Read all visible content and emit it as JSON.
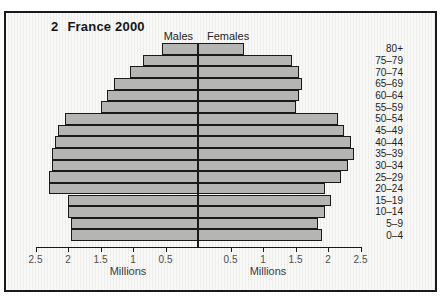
{
  "colors": {
    "background": "#f2f2f0",
    "frame_border": "#1a1a1a",
    "bar_fill": "#b5b5b3",
    "bar_border": "#1a1a1a",
    "axis_text": "#4d4d4d"
  },
  "chart_data": {
    "type": "bar",
    "variant": "population-pyramid",
    "figure_number": "2",
    "title": "France 2000",
    "left_header": "Males",
    "right_header": "Females",
    "xlabel": "Millions",
    "unit": "millions of people",
    "categories_top_to_bottom": [
      "80+",
      "75–79",
      "70–74",
      "65–69",
      "60–64",
      "55–59",
      "50–54",
      "45–49",
      "40–44",
      "35–39",
      "30–34",
      "25–29",
      "20–24",
      "15–19",
      "10–14",
      "5–9",
      "0–4"
    ],
    "series": [
      {
        "name": "Males",
        "side": "left",
        "values_top_to_bottom": [
          0.55,
          0.85,
          1.05,
          1.3,
          1.4,
          1.5,
          2.05,
          2.15,
          2.2,
          2.25,
          2.25,
          2.3,
          2.3,
          2.0,
          2.0,
          1.95,
          1.95
        ]
      },
      {
        "name": "Females",
        "side": "right",
        "values_top_to_bottom": [
          0.7,
          1.45,
          1.55,
          1.6,
          1.55,
          1.5,
          2.15,
          2.25,
          2.35,
          2.4,
          2.3,
          2.2,
          1.95,
          2.05,
          1.95,
          1.85,
          1.9
        ]
      }
    ],
    "axis_ticks": [
      0.5,
      1,
      1.5,
      2,
      2.5
    ],
    "xlim_each_side": [
      0,
      2.7
    ],
    "legend_position": "none",
    "grid": false
  }
}
